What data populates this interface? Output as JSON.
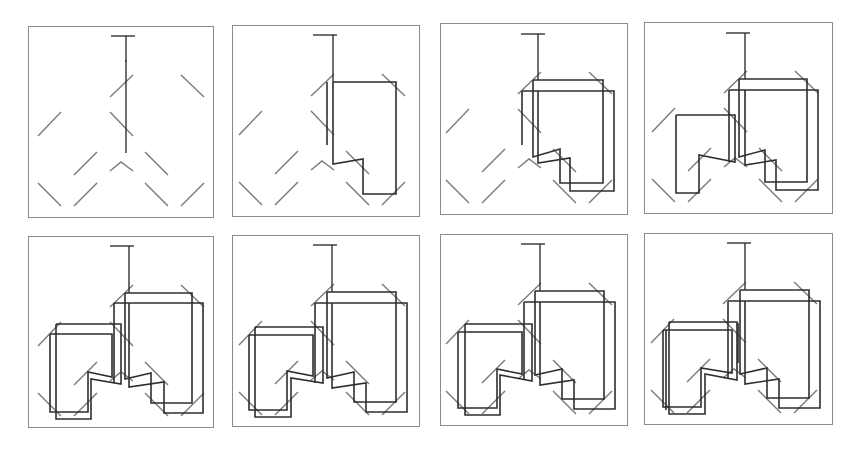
{
  "figure": {
    "rows": 2,
    "columns": 4,
    "colors": {
      "frame": "#8a8a8a",
      "terminal_segment": "#7a7a7a",
      "wire": "#2e2e2e",
      "background": "#ffffff"
    },
    "panels": [
      {
        "index": 1,
        "step": "terminals only",
        "boxes": 0
      },
      {
        "index": 2,
        "step": "first right-side connection",
        "boxes": 1
      },
      {
        "index": 3,
        "step": "right-side connection doubled",
        "boxes": 2
      },
      {
        "index": 4,
        "step": "left-side connection added",
        "boxes": 3
      },
      {
        "index": 5,
        "step": "both sides doubled",
        "boxes": 4
      },
      {
        "index": 6,
        "step": "refined",
        "boxes": 4
      },
      {
        "index": 7,
        "step": "refined",
        "boxes": 4
      },
      {
        "index": 8,
        "step": "final",
        "boxes": 4
      }
    ]
  }
}
